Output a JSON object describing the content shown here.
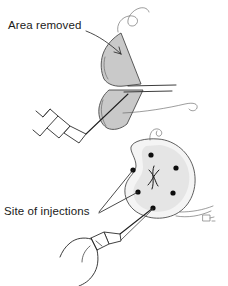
{
  "figure": {
    "background_color": "#ffffff",
    "ink_color": "#262626",
    "wedge_fill_color": "#c9c9c9",
    "organ_fill_color": "#f2f2f2",
    "dot_color": "#0d0d0d",
    "panels": [
      {
        "id": "upper",
        "name": "wedge-resection-panel",
        "caption": "Area removed"
      },
      {
        "id": "lower",
        "name": "injection-sites-panel",
        "caption": "Site of injections"
      }
    ]
  },
  "labels": {
    "area_removed": "Area removed",
    "site_of_injections": "Site of injections"
  },
  "upper_panel": {
    "label": "Area removed",
    "label_x": 8,
    "label_y": 29,
    "leader_line": "from label to upper wedge interior",
    "wedges": [
      {
        "name": "upper-wedge",
        "fill": "#c9c9c9"
      },
      {
        "name": "lower-wedge",
        "fill": "#c9c9c9"
      }
    ],
    "suture_threads": 2,
    "instrument": "syringe-with-needle"
  },
  "lower_panel": {
    "label": "Site of injections",
    "label_x": 4,
    "label_y": 215,
    "injection_site_count": 6,
    "injection_sites": [
      {
        "id": 1,
        "x": 151,
        "y": 155,
        "r": 2.6
      },
      {
        "id": 2,
        "x": 133,
        "y": 170,
        "r": 2.6
      },
      {
        "id": 3,
        "x": 176,
        "y": 168,
        "r": 2.6
      },
      {
        "id": 4,
        "x": 138,
        "y": 192,
        "r": 2.6
      },
      {
        "id": 5,
        "x": 173,
        "y": 193,
        "r": 2.6
      },
      {
        "id": 6,
        "x": 153,
        "y": 208,
        "r": 2.6
      }
    ],
    "leader_lines": 2,
    "instrument": "syringe-with-needle",
    "hand": "gloved-hand-holding-syringe",
    "signature_mark": "artist-monogram"
  }
}
